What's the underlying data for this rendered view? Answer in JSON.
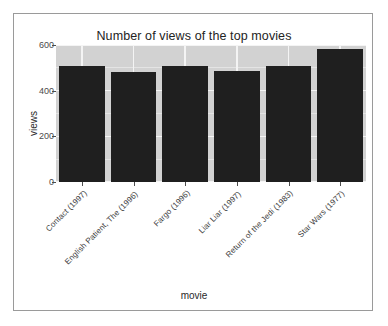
{
  "chart_data": {
    "type": "bar",
    "title": "Number of views of the top movies",
    "xlabel": "movie",
    "ylabel": "views",
    "categories": [
      "Contact (1997)",
      "English Patient, The (1996)",
      "Fargo (1996)",
      "Liar Liar (1997)",
      "Return of the Jedi (1983)",
      "Star Wars (1977)"
    ],
    "values": [
      509,
      481,
      508,
      485,
      507,
      584
    ],
    "ylim": [
      0,
      600
    ],
    "yticks": [
      0,
      200,
      400,
      600
    ],
    "ytick_labels": [
      "0",
      "200",
      "400",
      "600"
    ],
    "grid": true,
    "legend": "none",
    "bar_color": "#1f1f1f",
    "panel_color": "#d2d2d2",
    "gridline_color": "#f4f4f4",
    "background_color": "#ffffff",
    "frame_color": "#9a9a9a"
  }
}
